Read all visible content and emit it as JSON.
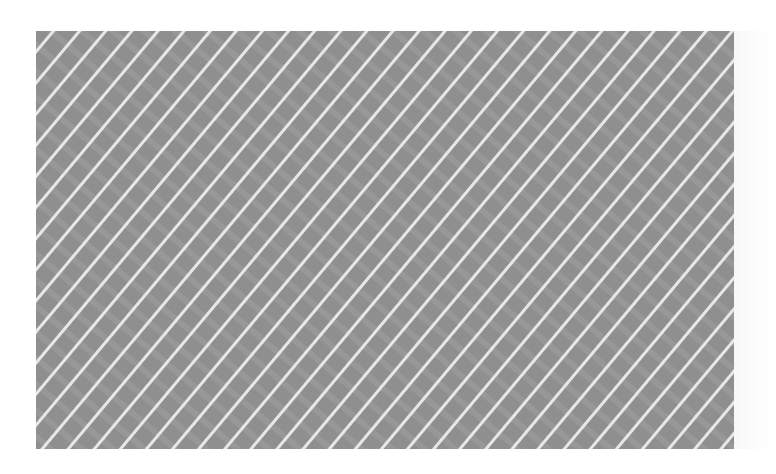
{
  "canvas": {
    "width": 776,
    "height": 474,
    "background": "#ffffff"
  },
  "pattern_box": {
    "description": "gray panel with diagonal white stripe pattern",
    "x": 36,
    "y": 31,
    "width": 698,
    "height": 418,
    "base_color": "#8f8f8f",
    "stripe_color": "#ececec",
    "band_color": "#9a9a9a",
    "stripe_angle_deg": 40,
    "stripe_spacing_px": 31
  }
}
